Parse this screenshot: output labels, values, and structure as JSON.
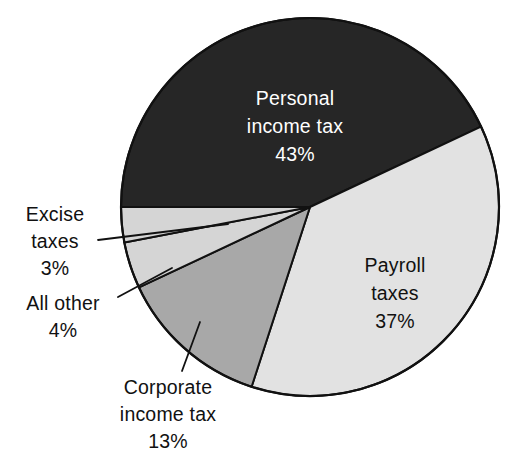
{
  "chart_data": {
    "type": "pie",
    "title": "",
    "subtitle": "",
    "xlabel": "",
    "ylabel": "",
    "legend_position": "none",
    "grid": false,
    "unit": "%",
    "total": 100,
    "categories": [
      "Personal income tax",
      "Payroll taxes",
      "Corporate income tax",
      "All other",
      "Excise taxes"
    ],
    "values": [
      43,
      37,
      13,
      4,
      3
    ],
    "slices": [
      {
        "id": "personal-income-tax",
        "name_line1": "Personal",
        "name_line2": "income tax",
        "value_label": "43%",
        "value": 43,
        "color": "#262626",
        "label_placement": "inside",
        "label_text_color": "#ffffff"
      },
      {
        "id": "payroll-taxes",
        "name_line1": "Payroll",
        "name_line2": "taxes",
        "value_label": "37%",
        "value": 37,
        "color": "#e2e2e2",
        "label_placement": "inside",
        "label_text_color": "#111111"
      },
      {
        "id": "corporate-income-tax",
        "name_line1": "Corporate",
        "name_line2": "income tax",
        "value_label": "13%",
        "value": 13,
        "color": "#a8a8a8",
        "label_placement": "outside",
        "label_text_color": "#111111"
      },
      {
        "id": "all-other",
        "name_line1": "All other",
        "name_line2": "",
        "value_label": "4%",
        "value": 4,
        "color": "#d5d5d5",
        "label_placement": "outside",
        "label_text_color": "#111111"
      },
      {
        "id": "excise-taxes",
        "name_line1": "Excise",
        "name_line2": "taxes",
        "value_label": "3%",
        "value": 3,
        "color": "#d5d5d5",
        "label_placement": "outside",
        "label_text_color": "#111111"
      }
    ],
    "colors": {
      "background": "#ffffff",
      "outline": "#111111",
      "dark_slice": "#262626",
      "light_slice": "#e2e2e2",
      "mid_slice": "#a8a8a8",
      "thin_slice": "#d5d5d5",
      "text": "#111111",
      "text_on_dark": "#ffffff"
    }
  }
}
